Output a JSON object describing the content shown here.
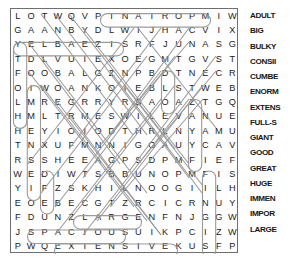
{
  "puzzle": {
    "title": "Word Search Puzzle",
    "rows": 17,
    "cols": 17,
    "grid": [
      [
        "L",
        "O",
        "T",
        "W",
        "Q",
        "V",
        "P",
        "T",
        "N",
        "A",
        "T",
        "R",
        "O",
        "P",
        "M",
        "I",
        "W"
      ],
      [
        "G",
        "A",
        "A",
        "N",
        "B",
        "Y",
        "D",
        "L",
        "W",
        "I",
        "J",
        "H",
        "A",
        "C",
        "V",
        "I",
        "X"
      ],
      [
        "Y",
        "E",
        "L",
        "B",
        "A",
        "E",
        "Z",
        "I",
        "S",
        "R",
        "F",
        "J",
        "U",
        "N",
        "A",
        "S",
        "G"
      ],
      [
        "T",
        "D",
        "L",
        "V",
        "U",
        "I",
        "E",
        "X",
        "O",
        "E",
        "G",
        "M",
        "T",
        "G",
        "V",
        "S",
        "T"
      ],
      [
        "F",
        "O",
        "O",
        "B",
        "A",
        "L",
        "G",
        "Z",
        "N",
        "P",
        "B",
        "D",
        "T",
        "N",
        "E",
        "C",
        "R"
      ],
      [
        "O",
        "I",
        "W",
        "O",
        "A",
        "N",
        "K",
        "O",
        "I",
        "E",
        "B",
        "L",
        "S",
        "T",
        "W",
        "E",
        "B"
      ],
      [
        "L",
        "M",
        "R",
        "E",
        "G",
        "R",
        "R",
        "Y",
        "R",
        "S",
        "A",
        "O",
        "A",
        "Z",
        "T",
        "G",
        "Q"
      ],
      [
        "H",
        "M",
        "L",
        "T",
        "R",
        "M",
        "E",
        "S",
        "W",
        "I",
        "L",
        "E",
        "V",
        "A",
        "N",
        "U",
        "E"
      ],
      [
        "H",
        "E",
        "Y",
        "I",
        "O",
        "I",
        "O",
        "D",
        "T",
        "H",
        "R",
        "L",
        "N",
        "Y",
        "A",
        "M",
        "U"
      ],
      [
        "T",
        "N",
        "X",
        "U",
        "F",
        "M",
        "N",
        "N",
        "I",
        "G",
        "O",
        "A",
        "U",
        "Y",
        "C",
        "A",
        "V"
      ],
      [
        "R",
        "S",
        "S",
        "H",
        "E",
        "E",
        "A",
        "G",
        "P",
        "S",
        "D",
        "P",
        "M",
        "F",
        "I",
        "E",
        "F"
      ],
      [
        "W",
        "E",
        "D",
        "I",
        "W",
        "T",
        "S",
        "B",
        "B",
        "U",
        "N",
        "O",
        "P",
        "M",
        "F",
        "I",
        "S"
      ],
      [
        "Y",
        "I",
        "F",
        "Z",
        "S",
        "K",
        "H",
        "I",
        "L",
        "N",
        "O",
        "O",
        "G",
        "I",
        "I",
        "L",
        "H"
      ],
      [
        "E",
        "O",
        "E",
        "B",
        "E",
        "C",
        "G",
        "T",
        "Z",
        "R",
        "C",
        "I",
        "C",
        "R",
        "N",
        "U",
        "Y"
      ],
      [
        "F",
        "D",
        "U",
        "N",
        "Z",
        "L",
        "A",
        "R",
        "G",
        "E",
        "N",
        "F",
        "N",
        "J",
        "G",
        "G",
        "W"
      ],
      [
        "J",
        "S",
        "P",
        "A",
        "C",
        "I",
        "O",
        "U",
        "S",
        "U",
        "I",
        "K",
        "P",
        "C",
        "I",
        "Z",
        "W"
      ],
      [
        "P",
        "W",
        "Q",
        "E",
        "X",
        "T",
        "E",
        "N",
        "S",
        "I",
        "V",
        "E",
        "K",
        "U",
        "S",
        "F",
        "P"
      ]
    ]
  },
  "word_list": {
    "label": "Word list",
    "words": [
      "ADULT",
      "BIG",
      "BULKY",
      "CONSII",
      "CUMBE",
      "ENORM",
      "EXTENS",
      "FULL-S",
      "GIANT",
      "GOOD",
      "GREAT",
      "HUGE",
      "IMMEN",
      "IMPOR",
      "LARGE"
    ]
  },
  "colors": {
    "letter": "#1b1b1b",
    "border": "#6e6e6e",
    "marking": "#9a9a9a",
    "word": "#161616",
    "background": "#ffffff"
  }
}
